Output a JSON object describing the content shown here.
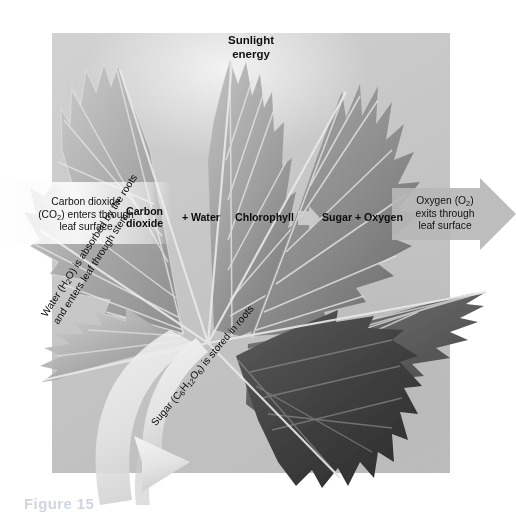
{
  "figure": {
    "domain": "photosynthesis-diagram",
    "caption": "Figure 15",
    "panel_background_color": "#c6c6c6",
    "page_background_color": "#ffffff",
    "text_color": "#111111"
  },
  "labels": {
    "sunlight": "Sunlight\nenergy",
    "sunlight_line1": "Sunlight",
    "sunlight_line2": "energy",
    "carbon_dioxide_in_line1": "Carbon dioxide",
    "carbon_dioxide_in_line2": "(CO₂) enters through",
    "carbon_dioxide_in_line3": "leaf surface",
    "oxygen_out_line1": "Oxygen (O₂)",
    "oxygen_out_line2": "exits through",
    "oxygen_out_line3": "leaf surface",
    "water_caption_line1": "Water (H₂O) is absorbed by the roots",
    "water_caption_line2": "and enters leaf through stem",
    "sugar_caption": "Sugar (C₆H₁₂O₆) is stored in roots"
  },
  "equation": {
    "reactant_1_line1": "Carbon",
    "reactant_1_line2": "dioxide",
    "operator_plus_1": "+",
    "reactant_2": "Water",
    "catalyst": "Chlorophyll",
    "arrow": "→",
    "product_1": "Sugar",
    "operator_plus_2": "+",
    "product_2": "Oxygen",
    "products_combined": "Sugar + Oxygen",
    "full_text": "Carbon dioxide + Water  Chlorophyll → Sugar + Oxygen"
  },
  "arrows": {
    "oxygen_exit_direction": "right",
    "oxygen_exit_color": "#b4b4b4",
    "water_uptake_direction": "curved-down-right",
    "water_uptake_color": "#e9e9e9",
    "sugar_transport_color": "#efefef",
    "equation_arrow_color": "#d6d6d6"
  },
  "leaf": {
    "species_depicted": "maple",
    "colors": {
      "light": "#c9c9c9",
      "mid": "#9a9a9a",
      "dark": "#6d6d6d",
      "darkest": "#4a4a4a",
      "vein": "#e2e2e2"
    }
  }
}
